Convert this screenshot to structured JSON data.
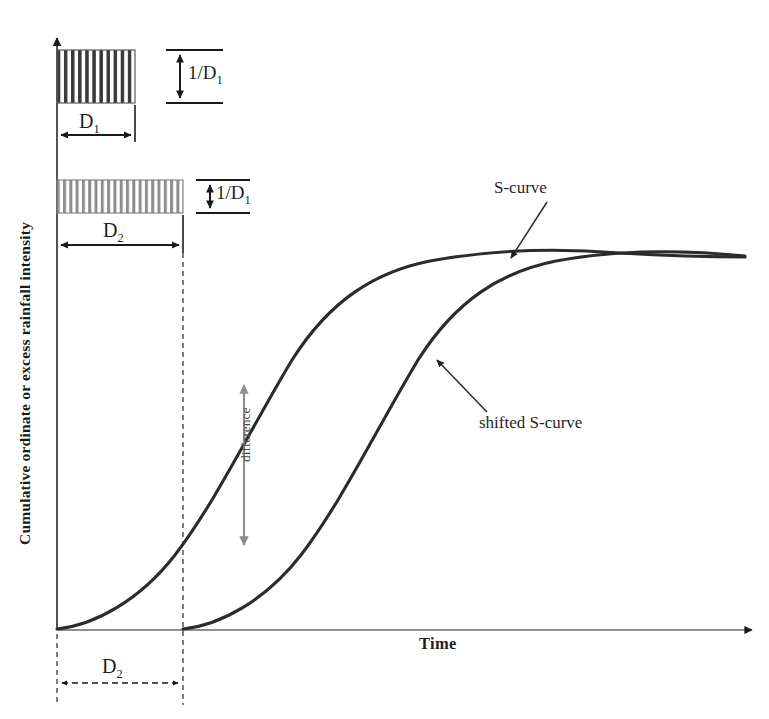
{
  "figure": {
    "type": "diagram",
    "axes": {
      "y_label": "Cumulative ordinate or excess rainfall intensity",
      "x_label": "Time",
      "y_arrow": "up",
      "x_arrow": "right"
    },
    "blocks": [
      {
        "name": "first-rainfall-block",
        "duration_label": "D",
        "duration_sub": "1",
        "intensity_label": "1/D",
        "intensity_sub": "1",
        "hatch": "vertical-stripes",
        "hatch_color": "#3a3a3a",
        "x": 57,
        "y": 50,
        "width": 78,
        "height": 53
      },
      {
        "name": "second-rainfall-block",
        "duration_label": "D",
        "duration_sub": "2",
        "intensity_label": "1/D",
        "intensity_sub": "1",
        "hatch": "vertical-stripes",
        "hatch_color": "#8a8a8a",
        "x": 57,
        "y": 180,
        "width": 126,
        "height": 33
      }
    ],
    "curves": [
      {
        "name": "s-curve",
        "label": "S-curve",
        "color": "#2b2b2b",
        "start_x": 57,
        "saturation_y": 255
      },
      {
        "name": "shifted-s-curve",
        "label": "shifted S-curve",
        "color": "#2b2b2b",
        "start_x": 183,
        "saturation_y": 258
      }
    ],
    "annotations": [
      {
        "name": "difference-arrow",
        "label": "difference",
        "color": "#8c8c8c",
        "top_y": 383,
        "bottom_y": 543,
        "x": 244
      },
      {
        "name": "shift-dimension",
        "label": "D",
        "sub": "2",
        "style": "dashed",
        "from_x": 57,
        "to_x": 183,
        "y": 683
      }
    ]
  }
}
